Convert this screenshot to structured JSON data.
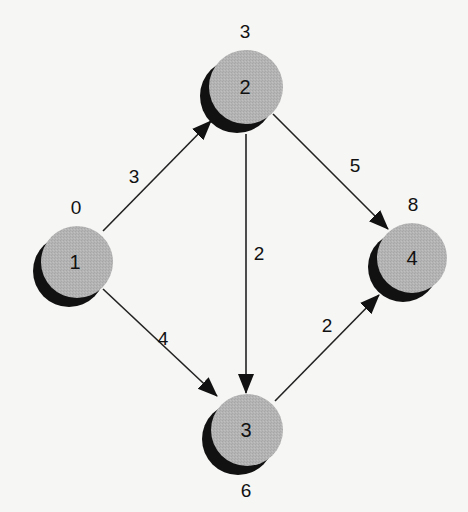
{
  "diagram": {
    "type": "activity-network",
    "colors": {
      "node_fill": "#b3b3b3",
      "node_shadow": "#111111",
      "edge": "#222222",
      "text": "#111111",
      "background": "#f6f6f4"
    },
    "nodes": [
      {
        "id": "1",
        "label": "1",
        "event_time": "0",
        "cx": 77,
        "cy": 262,
        "r": 36
      },
      {
        "id": "2",
        "label": "2",
        "event_time": "3",
        "cx": 246,
        "cy": 87,
        "r": 37
      },
      {
        "id": "3",
        "label": "3",
        "event_time": "6",
        "cx": 247,
        "cy": 430,
        "r": 36
      },
      {
        "id": "4",
        "label": "4",
        "event_time": "8",
        "cx": 412,
        "cy": 258,
        "r": 35
      }
    ],
    "edges": [
      {
        "from": "1",
        "to": "2",
        "weight": "3"
      },
      {
        "from": "1",
        "to": "3",
        "weight": "4"
      },
      {
        "from": "2",
        "to": "3",
        "weight": "2"
      },
      {
        "from": "2",
        "to": "4",
        "weight": "5"
      },
      {
        "from": "3",
        "to": "4",
        "weight": "2"
      }
    ]
  }
}
